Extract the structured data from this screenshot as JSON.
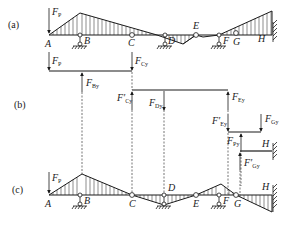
{
  "figure": {
    "parts": [
      {
        "id": "a",
        "label": "(a)"
      },
      {
        "id": "b",
        "label": "(b)"
      },
      {
        "id": "c",
        "label": "(c)"
      }
    ],
    "points": {
      "A": "A",
      "B": "B",
      "C": "C",
      "D": "D",
      "E": "E",
      "F": "F",
      "G": "G",
      "H": "H"
    },
    "forces": {
      "FP": {
        "main": "F",
        "sub": "P"
      },
      "FBy": {
        "main": "F",
        "sub": "By"
      },
      "FCy": {
        "main": "F",
        "sub": "Cy"
      },
      "FCy_prime": {
        "main": "F′",
        "sub": "Cy"
      },
      "FDy": {
        "main": "F",
        "sub": "Dy"
      },
      "FEy": {
        "main": "F",
        "sub": "Ey"
      },
      "FEy_prime": {
        "main": "F′",
        "sub": "Ey"
      },
      "FPy": {
        "main": "F",
        "sub": "Py"
      },
      "FGy": {
        "main": "F",
        "sub": "Gy"
      },
      "FGy_prime": {
        "main": "F′",
        "sub": "Gy"
      }
    },
    "colors": {
      "ink": "#1a1a1a",
      "background": "#ffffff"
    }
  }
}
